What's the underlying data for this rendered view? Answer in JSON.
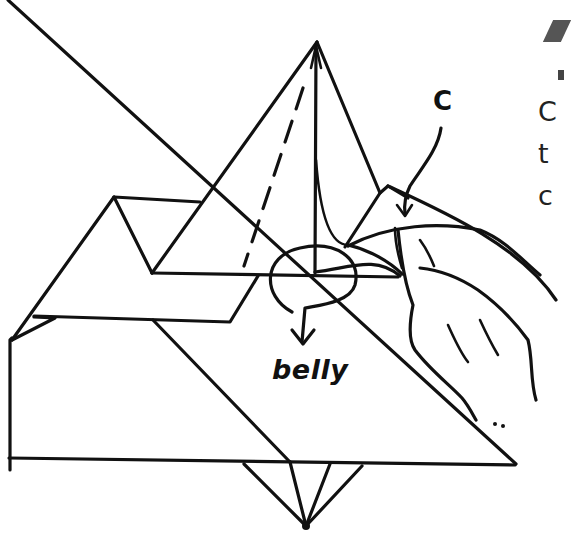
{
  "diagram": {
    "type": "origami folding step",
    "labels": {
      "belly": "belly",
      "point_c": "C"
    },
    "side_text_fragments": [
      "C",
      "t",
      "c"
    ],
    "stroke_color": "#111111",
    "background": "#ffffff",
    "elements": [
      "pyramid-flap",
      "dashed-fold-line",
      "rotation-arrow",
      "hand-pinching-paper",
      "curved-arrow-c",
      "base-rectangle",
      "bottom-triangle-fan"
    ]
  }
}
